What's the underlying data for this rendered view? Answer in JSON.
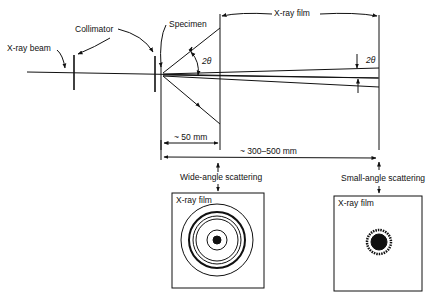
{
  "diagram": {
    "labels": {
      "xray_beam": "X-ray beam",
      "collimator": "Collimator",
      "specimen": "Specimen",
      "xray_film_top": "X-ray film",
      "two_theta_wide": "2θ",
      "two_theta_small": "2θ",
      "dist_wide": "~ 50 mm",
      "dist_small": "~ 300–500 mm",
      "wide_angle": "Wide-angle scattering",
      "small_angle": "Small-angle scattering",
      "film_wide": "X-ray film",
      "film_small": "X-ray film"
    },
    "colors": {
      "ink": "#111111",
      "background": "#ffffff"
    }
  }
}
